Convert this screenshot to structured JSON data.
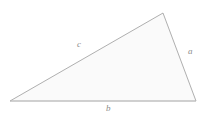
{
  "figure": {
    "name": "triangle-figure",
    "type": "geometric-diagram",
    "shape": "scalene-triangle",
    "background_color": "#ffffff",
    "fill_color": "#fafafa",
    "stroke_color": "#9a9a9a",
    "label_color": "#8c8c8c",
    "stroke_width": 0.8,
    "width": 209,
    "height": 119
  },
  "vertices": [
    {
      "name": "left-vertex",
      "x": 10,
      "y": 101
    },
    {
      "name": "top-right-vertex",
      "x": 163,
      "y": 13
    },
    {
      "name": "bottom-right-vertex",
      "x": 196,
      "y": 101
    }
  ],
  "polygon_points": "10,101 163,13 196,101",
  "sides": [
    {
      "id": "a",
      "label": "a",
      "from": "top-right-vertex",
      "to": "bottom-right-vertex",
      "label_x": 188,
      "label_y": 47
    },
    {
      "id": "b",
      "label": "b",
      "from": "left-vertex",
      "to": "bottom-right-vertex",
      "label_x": 106,
      "label_y": 104
    },
    {
      "id": "c",
      "label": "c",
      "from": "left-vertex",
      "to": "top-right-vertex",
      "label_x": 77,
      "label_y": 40
    }
  ]
}
